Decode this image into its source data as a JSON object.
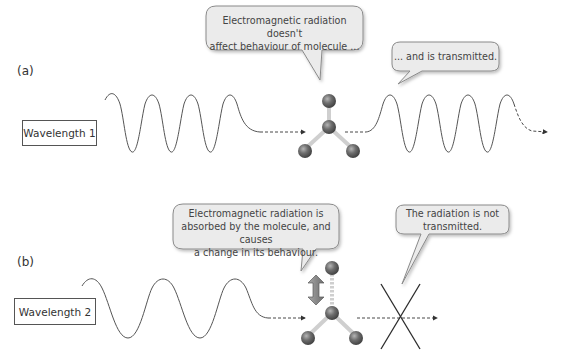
{
  "panels": [
    {
      "id": "a",
      "label": "(a)",
      "wavelength_label": "Wavelength 1",
      "bubbles": [
        {
          "text_lines": [
            "Electromagnetic radiation doesn't",
            "affect behaviour of molecule ..."
          ]
        },
        {
          "text_lines": [
            "... and is transmitted."
          ]
        }
      ],
      "outcome": "transmitted"
    },
    {
      "id": "b",
      "label": "(b)",
      "wavelength_label": "Wavelength 2",
      "bubbles": [
        {
          "text_lines": [
            "Electromagnetic radiation is",
            "absorbed by the molecule, and causes",
            "a change in its behaviour."
          ]
        },
        {
          "text_lines": [
            "The radiation is not",
            "transmitted."
          ]
        }
      ],
      "outcome": "not-transmitted"
    }
  ],
  "icons": {
    "molecule": "molecule-icon",
    "double_arrow": "double-arrow-icon",
    "blocked": "cross-icon"
  },
  "colors": {
    "bubble_fill": "#ebebeb",
    "bubble_stroke": "#8a8a8a",
    "wave": "#555555",
    "atom": "#6a6a6a",
    "bond": "#cfcfcf",
    "arrow_fill": "#8d8d8d"
  }
}
